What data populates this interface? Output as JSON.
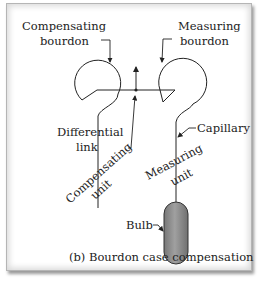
{
  "diagram": {
    "caption": "(b) Bourdon case compensation",
    "labels": {
      "compensating_bourdon_line1": "Compensating",
      "compensating_bourdon_line2": "bourdon",
      "measuring_bourdon_line1": "Measuring",
      "measuring_bourdon_line2": "bourdon",
      "differential_link_line1": "Differential",
      "differential_link_line2": "link",
      "capillary": "Capillary",
      "compensating_unit_line1": "Compensating",
      "compensating_unit_line2": "unit",
      "measuring_unit_line1": "Measuring",
      "measuring_unit_line2": "unit",
      "bulb": "Bulb"
    },
    "colors": {
      "line": "#222222",
      "bulb_fill": "#8a8a8a",
      "bulb_stroke": "#333333",
      "frame_border": "#b5b5b5"
    }
  }
}
